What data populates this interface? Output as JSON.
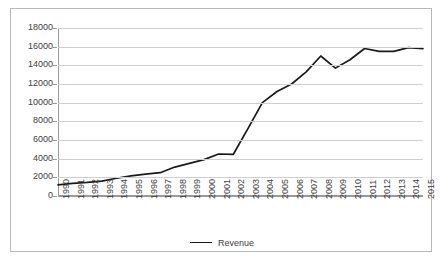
{
  "chart_data": {
    "type": "line",
    "title": "",
    "xlabel": "",
    "ylabel": "",
    "grid": true,
    "legend_position": "bottom",
    "ylim": [
      0,
      18000
    ],
    "ytick_step": 2000,
    "ytick_labels": [
      "18000",
      "16000",
      "14000",
      "12000",
      "10000",
      "8000",
      "6000",
      "4000",
      "2000",
      "0"
    ],
    "ytick_values": [
      18000,
      16000,
      14000,
      12000,
      10000,
      8000,
      6000,
      4000,
      2000,
      0
    ],
    "categories": [
      "1990",
      "1991",
      "1992",
      "1993",
      "1994",
      "1995",
      "1996",
      "1997",
      "1998",
      "1999",
      "2000",
      "2001",
      "2002",
      "2003",
      "2004",
      "2005",
      "2006",
      "2007",
      "2008",
      "2009",
      "2010",
      "2011",
      "2012",
      "2013",
      "2014",
      "2015"
    ],
    "series": [
      {
        "name": "Revenue",
        "color": "#1a1a1a",
        "values": [
          1200,
          1350,
          1450,
          1600,
          1900,
          2150,
          2350,
          2500,
          3100,
          3500,
          3900,
          4500,
          4450,
          7200,
          10000,
          11200,
          12000,
          13300,
          15000,
          13700,
          14600,
          15800,
          15500,
          15500,
          15900,
          15800
        ]
      }
    ],
    "legend": [
      {
        "label": "Revenue",
        "color": "#1a1a1a"
      }
    ]
  }
}
